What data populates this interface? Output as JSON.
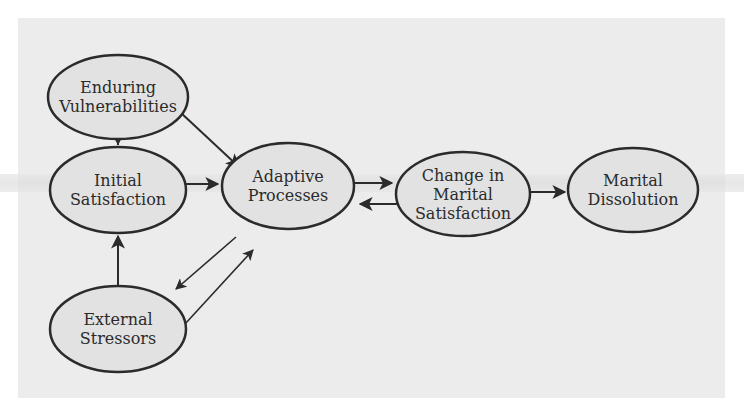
{
  "diagram": {
    "type": "flow-model",
    "colors": {
      "panel": "#ececec",
      "node_fill": "#e2e2e2",
      "stroke": "#2b2b2b"
    },
    "nodes": [
      {
        "id": "enduring",
        "lines": [
          "Enduring",
          "Vulnerabilities"
        ],
        "cx": 118,
        "cy": 97,
        "rx": 70,
        "ry": 42
      },
      {
        "id": "initial",
        "lines": [
          "Initial",
          "Satisfaction"
        ],
        "cx": 118,
        "cy": 190,
        "rx": 68,
        "ry": 43
      },
      {
        "id": "adaptive",
        "lines": [
          "Adaptive",
          "Processes"
        ],
        "cx": 288,
        "cy": 186,
        "rx": 66,
        "ry": 43
      },
      {
        "id": "change",
        "lines": [
          "Change in",
          "Marital",
          "Satisfaction"
        ],
        "cx": 463,
        "cy": 194,
        "rx": 67,
        "ry": 42
      },
      {
        "id": "dissolution",
        "lines": [
          "Marital",
          "Dissolution"
        ],
        "cx": 633,
        "cy": 190,
        "rx": 65,
        "ry": 42
      },
      {
        "id": "external",
        "lines": [
          "External",
          "Stressors"
        ],
        "cx": 118,
        "cy": 329,
        "rx": 68,
        "ry": 43
      }
    ],
    "edges": [
      {
        "from": "enduring",
        "to": "initial"
      },
      {
        "from": "enduring",
        "to": "adaptive"
      },
      {
        "from": "initial",
        "to": "adaptive"
      },
      {
        "from": "adaptive",
        "to": "change"
      },
      {
        "from": "change",
        "to": "adaptive"
      },
      {
        "from": "change",
        "to": "dissolution"
      },
      {
        "from": "external",
        "to": "initial"
      },
      {
        "from": "adaptive",
        "to": "external"
      },
      {
        "from": "external",
        "to": "adaptive"
      }
    ]
  }
}
